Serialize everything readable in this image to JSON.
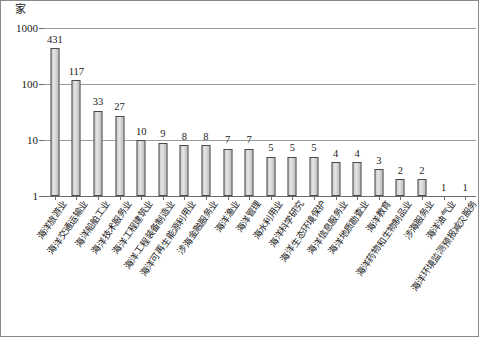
{
  "chart_data": {
    "type": "bar",
    "title": "",
    "subtitle": "",
    "xlabel": "",
    "ylabel": "家",
    "unit_label": "家",
    "yscale": "log",
    "ylim": [
      1,
      1000
    ],
    "ytick_labels": [
      "1000",
      "100",
      "10",
      "1"
    ],
    "ytick_values": [
      1000,
      100,
      10,
      1
    ],
    "grid": true,
    "legend": "none",
    "categories": [
      "海洋旅游业",
      "海洋交通运输业",
      "海洋船舶工业",
      "海洋技术服务业",
      "海洋工程建筑业",
      "海洋工程装备制造业",
      "海洋可再生能源利用业",
      "涉海金融服务业",
      "海洋渔业",
      "海洋管理",
      "海水利用业",
      "海洋科学研究",
      "海洋生态环境保护",
      "海洋信息服务业",
      "海洋地质勘查业",
      "海洋教育",
      "海洋药物和生物制品业",
      "涉海服务业",
      "海洋油气业",
      "海洋环境监测预报减灾服务"
    ],
    "values": [
      431,
      117,
      33,
      27,
      10,
      9,
      8,
      8,
      7,
      7,
      5,
      5,
      5,
      4,
      4,
      3,
      2,
      2,
      1,
      1
    ],
    "value_labels": [
      "431",
      "117",
      "33",
      "27",
      "10",
      "9",
      "8",
      "8",
      "7",
      "7",
      "5",
      "5",
      "5",
      "4",
      "4",
      "3",
      "2",
      "2",
      "1",
      "1"
    ],
    "bar_color": "#d5d5d5",
    "bar_border_color": "#4a4a4a",
    "gridline_color": "#9a9a9a",
    "axis_color": "#6d6d6d",
    "frame_color": "#8a8a8a"
  }
}
